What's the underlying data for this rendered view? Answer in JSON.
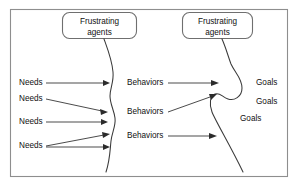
{
  "diagram": {
    "frame": {
      "stroke_color": "#8e8e8e"
    },
    "barrier_color": "#3a3a3a",
    "arrow_color": "#2b2b2b",
    "agent_boxes": [
      {
        "id": "agent-box-left",
        "line1": "Frustrating",
        "line2": "agents"
      },
      {
        "id": "agent-box-right",
        "line1": "Frustrating",
        "line2": "agents"
      }
    ],
    "needs": [
      {
        "label": "Needs"
      },
      {
        "label": "Needs"
      },
      {
        "label": "Needs"
      },
      {
        "label": "Needs"
      }
    ],
    "behaviors": [
      {
        "label": "Behaviors"
      },
      {
        "label": "Behaviors"
      },
      {
        "label": "Behaviors"
      }
    ],
    "goals": [
      {
        "label": "Goals"
      },
      {
        "label": "Goals"
      },
      {
        "label": "Goals"
      }
    ]
  }
}
